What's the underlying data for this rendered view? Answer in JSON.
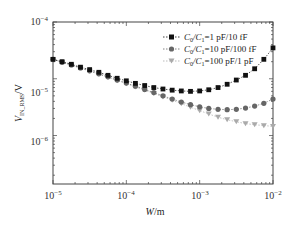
{
  "chart_data": {
    "type": "line",
    "title": "",
    "xlabel": "W/m",
    "ylabel": "V_IN_RMS/V",
    "xscale": "log",
    "yscale": "log",
    "xlim": [
      1e-05,
      0.01
    ],
    "ylim": [
      1.4e-07,
      0.0001
    ],
    "x_ticks": [
      "10^-5",
      "10^-4",
      "10^-3",
      "10^-2"
    ],
    "y_ticks": [
      "10^-4",
      "10^-5",
      "10^-6"
    ],
    "legend_position": "upper right",
    "grid": false,
    "x": [
      1e-05,
      1.33e-05,
      1.78e-05,
      2.37e-05,
      3.16e-05,
      4.22e-05,
      5.62e-05,
      7.5e-05,
      0.0001,
      0.000133,
      0.000178,
      0.000237,
      0.000316,
      0.000422,
      0.000562,
      0.00075,
      0.001,
      0.00133,
      0.00178,
      0.00237,
      0.00316,
      0.00422,
      0.00562,
      0.0075,
      0.01
    ],
    "series": [
      {
        "name": "C0/C1 = 1 pF/10 fF",
        "marker": "square",
        "color": "#111111",
        "values": [
          2.2e-05,
          2e-05,
          1.8e-05,
          1.6e-05,
          1.45e-05,
          1.3e-05,
          1.15e-05,
          1.02e-05,
          9.2e-06,
          8.3e-06,
          7.6e-06,
          7e-06,
          6.6e-06,
          6.3e-06,
          6.1e-06,
          6e-06,
          6.1e-06,
          6.4e-06,
          7e-06,
          8e-06,
          9.5e-06,
          1.15e-05,
          1.5e-05,
          2.2e-05,
          3.5e-05
        ]
      },
      {
        "name": "C0/C1 = 10 pF/100 fF",
        "marker": "circle",
        "color": "#666666",
        "values": [
          2.2e-05,
          1.95e-05,
          1.75e-05,
          1.55e-05,
          1.38e-05,
          1.22e-05,
          1.08e-05,
          9.5e-06,
          8.4e-06,
          7.4e-06,
          6.5e-06,
          5.7e-06,
          5e-06,
          4.4e-06,
          3.9e-06,
          3.5e-06,
          3.2e-06,
          3e-06,
          2.9e-06,
          2.85e-06,
          2.9e-06,
          3.05e-06,
          3.3e-06,
          3.7e-06,
          4.4e-06
        ]
      },
      {
        "name": "C0/C1 = 100 pF/1 pF",
        "marker": "triangle-down",
        "color": "#aaaaaa",
        "values": [
          2.2e-05,
          1.95e-05,
          1.74e-05,
          1.54e-05,
          1.36e-05,
          1.2e-05,
          1.06e-05,
          9.3e-06,
          8.2e-06,
          7.2e-06,
          6.3e-06,
          5.5e-06,
          4.8e-06,
          4.2e-06,
          3.65e-06,
          3.15e-06,
          2.75e-06,
          2.4e-06,
          2.1e-06,
          1.9e-06,
          1.75e-06,
          1.62e-06,
          1.55e-06,
          1.5e-06,
          1.45e-06
        ]
      }
    ]
  },
  "axes": {
    "x_label_main": "W",
    "x_label_unit": "/m",
    "y_label_main": "V",
    "y_label_sub": "IN_RMS",
    "y_label_unit": "/V",
    "x_tick_labels": [
      {
        "base": "10",
        "exp": "−5"
      },
      {
        "base": "10",
        "exp": "−4"
      },
      {
        "base": "10",
        "exp": "−3"
      },
      {
        "base": "10",
        "exp": "−2"
      }
    ],
    "y_tick_labels": [
      {
        "base": "10",
        "exp": "−4"
      },
      {
        "base": "10",
        "exp": "−5"
      },
      {
        "base": "10",
        "exp": "−6"
      }
    ]
  },
  "legend": {
    "items": [
      {
        "lhs": "C",
        "lhs_sub": "0",
        "mid": "/C",
        "mid_sub": "1",
        "value": "=1 pF/10 fF"
      },
      {
        "lhs": "C",
        "lhs_sub": "0",
        "mid": "/C",
        "mid_sub": "1",
        "value": "=10 pF/100 fF"
      },
      {
        "lhs": "C",
        "lhs_sub": "0",
        "mid": "/C",
        "mid_sub": "1",
        "value": "=100 pF/1 pF"
      }
    ]
  }
}
